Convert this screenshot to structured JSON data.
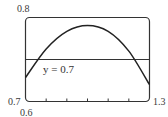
{
  "chart_data": {
    "type": "line",
    "title": "",
    "xlabel": "",
    "ylabel": "",
    "xlim": [
      0.7,
      1.3
    ],
    "ylim": [
      0.6,
      0.8
    ],
    "grid": false,
    "x_tick_step": 0.1,
    "tick_labels": {
      "y_top": "0.8",
      "y_bottom": "0.6",
      "x_left": "0.7",
      "x_right": "1.3"
    },
    "series": [
      {
        "name": "curve",
        "x": [
          0.7,
          0.8,
          0.9,
          1.0,
          1.1,
          1.2,
          1.3
        ],
        "values": [
          0.657,
          0.725,
          0.767,
          0.781,
          0.767,
          0.72,
          0.64
        ]
      },
      {
        "name": "y = 0.7",
        "x": [
          0.7,
          1.3
        ],
        "values": [
          0.7,
          0.7
        ]
      }
    ],
    "annotations": [
      {
        "text": "y = 0.7",
        "x": 0.78,
        "y": 0.69
      }
    ]
  },
  "labels": {
    "y_top": "0.8",
    "x_min": "0.7",
    "y_min": "0.6",
    "x_max": "1.3",
    "line": "y = 0.7"
  }
}
